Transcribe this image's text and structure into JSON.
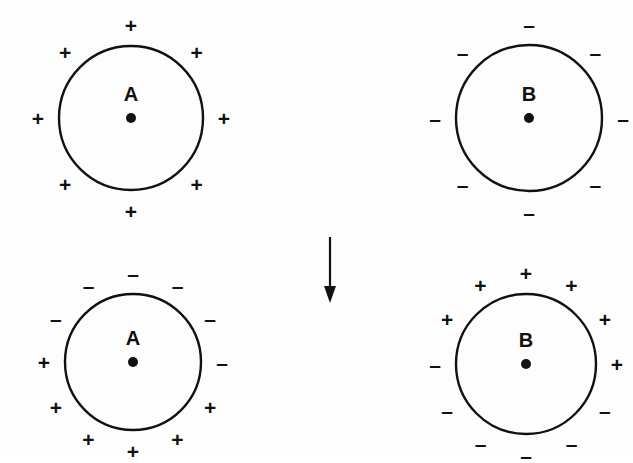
{
  "figure": {
    "background_color": "#fdfdfd",
    "stroke_color": "#111111",
    "symbols": {
      "plus": "+",
      "minus": "–",
      "arrow": "arrow-down"
    }
  },
  "panels": [
    {
      "id": "before-left",
      "label": "A",
      "stage": "before",
      "center": {
        "x": 131,
        "y": 118
      },
      "radius": 72,
      "charge_ring_radius": 93,
      "net_charge": "positive",
      "charge_count": 8,
      "charges": [
        {
          "angle": 270,
          "sign": "+"
        },
        {
          "angle": 315,
          "sign": "+"
        },
        {
          "angle": 0,
          "sign": "+"
        },
        {
          "angle": 45,
          "sign": "+"
        },
        {
          "angle": 90,
          "sign": "+"
        },
        {
          "angle": 135,
          "sign": "+"
        },
        {
          "angle": 180,
          "sign": "+"
        },
        {
          "angle": 225,
          "sign": "+"
        }
      ]
    },
    {
      "id": "before-right",
      "label": "B",
      "stage": "before",
      "center": {
        "x": 529,
        "y": 118
      },
      "radius": 73,
      "charge_ring_radius": 94,
      "net_charge": "negative",
      "charge_count": 8,
      "charges": [
        {
          "angle": 270,
          "sign": "–"
        },
        {
          "angle": 315,
          "sign": "–"
        },
        {
          "angle": 0,
          "sign": "–"
        },
        {
          "angle": 45,
          "sign": "–"
        },
        {
          "angle": 90,
          "sign": "–"
        },
        {
          "angle": 135,
          "sign": "–"
        },
        {
          "angle": 180,
          "sign": "–"
        },
        {
          "angle": 225,
          "sign": "–"
        }
      ]
    },
    {
      "id": "after-left",
      "label": "A",
      "stage": "after",
      "center": {
        "x": 133,
        "y": 362
      },
      "radius": 68,
      "charge_ring_radius": 89,
      "net_charge": "polarized",
      "charge_count": 12,
      "charges": [
        {
          "angle": 270,
          "sign": "–"
        },
        {
          "angle": 300,
          "sign": "–"
        },
        {
          "angle": 330,
          "sign": "–"
        },
        {
          "angle": 0,
          "sign": "–"
        },
        {
          "angle": 240,
          "sign": "–"
        },
        {
          "angle": 210,
          "sign": "–"
        },
        {
          "angle": 180,
          "sign": "+"
        },
        {
          "angle": 30,
          "sign": "+"
        },
        {
          "angle": 150,
          "sign": "+"
        },
        {
          "angle": 60,
          "sign": "+"
        },
        {
          "angle": 120,
          "sign": "+"
        },
        {
          "angle": 90,
          "sign": "+"
        }
      ]
    },
    {
      "id": "after-right",
      "label": "B",
      "stage": "after",
      "center": {
        "x": 526,
        "y": 364
      },
      "radius": 70,
      "charge_ring_radius": 91,
      "net_charge": "polarized",
      "charge_count": 12,
      "charges": [
        {
          "angle": 270,
          "sign": "+"
        },
        {
          "angle": 300,
          "sign": "+"
        },
        {
          "angle": 330,
          "sign": "+"
        },
        {
          "angle": 0,
          "sign": "+"
        },
        {
          "angle": 240,
          "sign": "+"
        },
        {
          "angle": 210,
          "sign": "+"
        },
        {
          "angle": 180,
          "sign": "–"
        },
        {
          "angle": 30,
          "sign": "–"
        },
        {
          "angle": 150,
          "sign": "–"
        },
        {
          "angle": 60,
          "sign": "–"
        },
        {
          "angle": 120,
          "sign": "–"
        },
        {
          "angle": 90,
          "sign": "–"
        }
      ]
    }
  ],
  "arrow": {
    "name": "down-arrow",
    "x": 330,
    "y_start": 237,
    "y_end": 303,
    "direction": "down",
    "color": "#111111"
  }
}
